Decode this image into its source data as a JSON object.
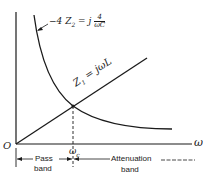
{
  "diagram": {
    "type": "impedance-frequency plot",
    "axes": {
      "origin_label": "O",
      "x_label": "ω",
      "cutoff_label_base": "ω",
      "cutoff_label_sub": "c"
    },
    "curves": {
      "capacitive": {
        "label_prefix": "−4 Z",
        "label_sub": "2",
        "label_eq": " = j",
        "frac_num": "4",
        "frac_den": "ωC"
      },
      "inductive": {
        "label_z": "Z",
        "label_sub": "1",
        "label_eq": " = jωL"
      }
    },
    "bands": {
      "pass_line1": "Pass",
      "pass_line2": "band",
      "atten_line1": "Attenuation",
      "atten_line2": "band"
    },
    "colors": {
      "ink": "#1a1a1a",
      "background": "#ffffff"
    }
  }
}
